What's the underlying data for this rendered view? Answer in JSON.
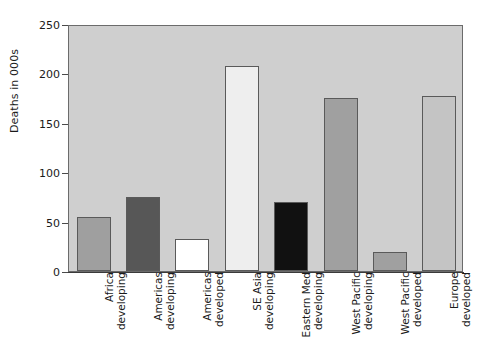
{
  "chart_data": {
    "type": "bar",
    "title": "",
    "subtitle": "",
    "xlabel": "",
    "ylabel": "Deaths in 000s",
    "ylim": [
      0,
      250
    ],
    "yticks": [
      0,
      50,
      100,
      150,
      200,
      250
    ],
    "ytick_labels": [
      "0",
      "50",
      "100",
      "150",
      "200",
      "250"
    ],
    "grid": false,
    "legend": null,
    "legend_position": "none",
    "plot_background_color": "#cfcfcf",
    "axis_color": "#4a4a4a",
    "categories": [
      "Africa developing",
      "Americas developing",
      "Americas developed",
      "SE Asia developing",
      "Eastern Med developing",
      "West Pacific developing",
      "West Pacific developed",
      "Europe developed"
    ],
    "category_lines": [
      [
        "Africa",
        "developing"
      ],
      [
        "Americas",
        "developing"
      ],
      [
        "Americas",
        "developed"
      ],
      [
        "SE Asia",
        "developing"
      ],
      [
        "Eastern Med",
        "developing"
      ],
      [
        "West Pacific",
        "developing"
      ],
      [
        "West Pacific",
        "developed"
      ],
      [
        "Europe",
        "developed"
      ]
    ],
    "values": [
      55,
      75,
      32,
      207,
      70,
      175,
      19,
      177
    ],
    "bar_colors": [
      "#9f9f9f",
      "#575757",
      "#ffffff",
      "#eeeeee",
      "#111111",
      "#a0a0a0",
      "#a0a0a0",
      "#c4c4c4"
    ]
  }
}
